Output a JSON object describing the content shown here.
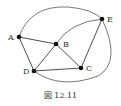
{
  "diagram": {
    "type": "graph",
    "nodes": [
      {
        "id": "A",
        "label": "A",
        "x": 19,
        "y": 37
      },
      {
        "id": "B",
        "label": "B",
        "x": 56,
        "y": 44
      },
      {
        "id": "C",
        "label": "C",
        "x": 81,
        "y": 68
      },
      {
        "id": "D",
        "label": "D",
        "x": 34,
        "y": 71
      },
      {
        "id": "E",
        "label": "E",
        "x": 102,
        "y": 19
      }
    ],
    "edges": [
      [
        "A",
        "B"
      ],
      [
        "A",
        "D"
      ],
      [
        "B",
        "D"
      ],
      [
        "B",
        "C"
      ],
      [
        "D",
        "C"
      ],
      [
        "C",
        "E"
      ],
      [
        "B",
        "E"
      ],
      [
        "A",
        "E"
      ],
      [
        "D",
        "E"
      ]
    ],
    "caption": "図 12.11"
  }
}
